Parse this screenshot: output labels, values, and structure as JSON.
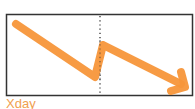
{
  "diagram": {
    "caption": "Xday",
    "colors": {
      "arrow": "#f7963a",
      "border": "#333333",
      "divider": "#333333",
      "caption": "#f0a050",
      "background": "#ffffff"
    },
    "box": {
      "x": 6,
      "y": 14,
      "width": 187,
      "height": 82
    },
    "divider": {
      "x": 100,
      "style": "dotted"
    },
    "arrow_path": [
      {
        "x": 16,
        "y": 24
      },
      {
        "x": 95,
        "y": 77
      },
      {
        "x": 103,
        "y": 45
      },
      {
        "x": 183,
        "y": 85
      }
    ],
    "arrow_head": {
      "tip": {
        "x": 185,
        "y": 87
      },
      "arm1": {
        "x": 181,
        "y": 72
      },
      "arm2": {
        "x": 171,
        "y": 91
      }
    }
  }
}
